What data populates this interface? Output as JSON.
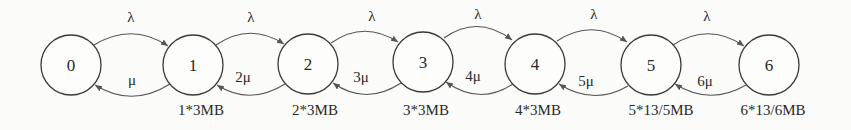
{
  "diagram": {
    "type": "birth-death markov chain",
    "states": [
      {
        "id": "0",
        "label": "0",
        "cx": 71,
        "cy": 65,
        "memory": ""
      },
      {
        "id": "1",
        "label": "1",
        "cx": 193,
        "cy": 65,
        "memory": "1*3MB"
      },
      {
        "id": "2",
        "label": "2",
        "cx": 308,
        "cy": 64,
        "memory": "2*3MB"
      },
      {
        "id": "3",
        "label": "3",
        "cx": 423,
        "cy": 62,
        "memory": "3*3MB"
      },
      {
        "id": "4",
        "label": "4",
        "cx": 535,
        "cy": 64,
        "memory": "4*3MB"
      },
      {
        "id": "5",
        "label": "5",
        "cx": 651,
        "cy": 65,
        "memory": "5*13/5MB"
      },
      {
        "id": "6",
        "label": "6",
        "cx": 769,
        "cy": 65,
        "memory": "6*13/6MB"
      }
    ],
    "forward_transitions": [
      {
        "from": "0",
        "to": "1",
        "label": "λ"
      },
      {
        "from": "1",
        "to": "2",
        "label": "λ"
      },
      {
        "from": "2",
        "to": "3",
        "label": "λ"
      },
      {
        "from": "3",
        "to": "4",
        "label": "λ"
      },
      {
        "from": "4",
        "to": "5",
        "label": "λ"
      },
      {
        "from": "5",
        "to": "6",
        "label": "λ"
      }
    ],
    "backward_transitions": [
      {
        "from": "1",
        "to": "0",
        "label": "μ"
      },
      {
        "from": "2",
        "to": "1",
        "label": "2μ"
      },
      {
        "from": "3",
        "to": "2",
        "label": "3μ"
      },
      {
        "from": "4",
        "to": "3",
        "label": "4μ"
      },
      {
        "from": "5",
        "to": "4",
        "label": "5μ"
      },
      {
        "from": "6",
        "to": "5",
        "label": "6μ"
      }
    ]
  }
}
